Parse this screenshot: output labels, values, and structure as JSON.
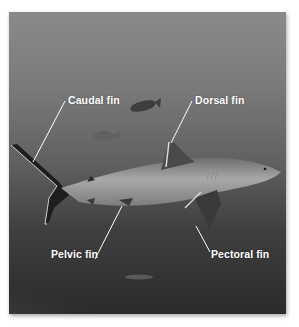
{
  "figure": {
    "labels": [
      {
        "id": "caudal",
        "text": "Caudal fin"
      },
      {
        "id": "dorsal",
        "text": "Dorsal fin"
      },
      {
        "id": "pelvic",
        "text": "Pelvic fin"
      },
      {
        "id": "pectoral",
        "text": "Pectoral fin"
      }
    ],
    "colors": {
      "label_text": "#ffffff",
      "leader_line": "#ffffff",
      "water_top": "#8a8a8a",
      "water_bottom": "#2b2b2b"
    }
  }
}
